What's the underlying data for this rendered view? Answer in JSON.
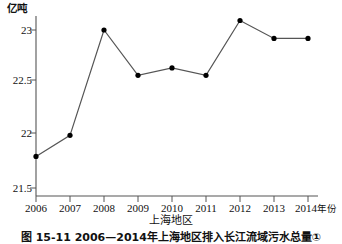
{
  "figure": {
    "y_unit_label": "亿吨",
    "x_unit_label": "年份",
    "region_label": "上海地区",
    "caption": "图 15-11  2006—2014年上海地区排入长江流域污水总量①"
  },
  "chart_data": {
    "type": "line",
    "title": "",
    "subtitle": "",
    "xlabel": "年份",
    "ylabel": "亿吨",
    "categories": [
      "2006",
      "2007",
      "2008",
      "2009",
      "2010",
      "2011",
      "2012",
      "2013",
      "2014"
    ],
    "x": [
      2006,
      2007,
      2008,
      2009,
      2010,
      2011,
      2012,
      2013,
      2014
    ],
    "values": [
      21.8,
      22.0,
      23.0,
      22.57,
      22.64,
      22.57,
      23.09,
      22.92,
      22.92
    ],
    "series": [
      {
        "name": "上海地区",
        "values": [
          21.8,
          22.0,
          23.0,
          22.57,
          22.64,
          22.57,
          23.09,
          22.92,
          22.92
        ]
      }
    ],
    "ylim": [
      21.5,
      23.15
    ],
    "yticks": [
      21.5,
      22,
      22.5,
      23
    ],
    "ytick_labels": [
      "21.5",
      "22",
      "22.5",
      "23"
    ],
    "xtick_labels": [
      "2006",
      "2007",
      "2008",
      "2009",
      "2010",
      "2011",
      "2012",
      "2013",
      "2014"
    ],
    "grid": false,
    "legend": "none",
    "marker": "filled-circle",
    "line_color": "#555555",
    "marker_color": "#000000",
    "axis_color": "#555555"
  }
}
